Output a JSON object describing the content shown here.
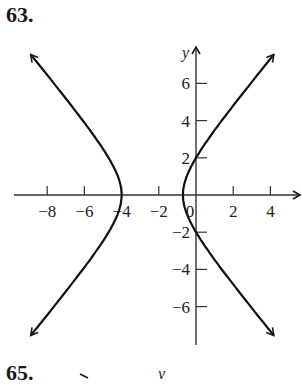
{
  "problems": {
    "top": "63.",
    "bottom": "65.",
    "bottom_axis_label": "y"
  },
  "chart_data": {
    "type": "line",
    "title": "",
    "xlabel": "x",
    "ylabel": "y",
    "xlim": [
      -10,
      5.5
    ],
    "ylim": [
      -8,
      8
    ],
    "grid": false,
    "x_ticks": [
      -8,
      -6,
      -4,
      -2,
      2,
      4
    ],
    "x_tick_labels": [
      "−8",
      "−6",
      "−4",
      "−2",
      "0",
      "2",
      "4"
    ],
    "y_ticks": [
      6,
      4,
      2,
      -2,
      -4,
      -6
    ],
    "y_tick_labels": [
      "6",
      "4",
      "2",
      "−2",
      "−4",
      "−6"
    ],
    "curve": {
      "kind": "hyperbola (horizontal transverse axis)",
      "center": [
        -2.35,
        0
      ],
      "a": 1.65,
      "b": 1.97,
      "vertices": [
        [
          -4,
          0
        ],
        [
          -0.7,
          0
        ]
      ],
      "y_intercepts": [
        [
          0,
          2
        ],
        [
          0,
          -2
        ]
      ]
    },
    "series": [
      {
        "name": "left branch",
        "x": [
          -9.6,
          -6.0,
          -4.6,
          -4.0,
          -4.6,
          -6.0,
          -9.6
        ],
        "y": [
          7.6,
          4.0,
          2.1,
          0,
          -2.1,
          -4.0,
          -7.6
        ]
      },
      {
        "name": "right branch",
        "x": [
          4.9,
          1.3,
          0,
          -0.7,
          0,
          1.3,
          4.9
        ],
        "y": [
          7.6,
          4.0,
          2.0,
          0,
          -2.0,
          -4.0,
          -7.6
        ]
      }
    ]
  }
}
